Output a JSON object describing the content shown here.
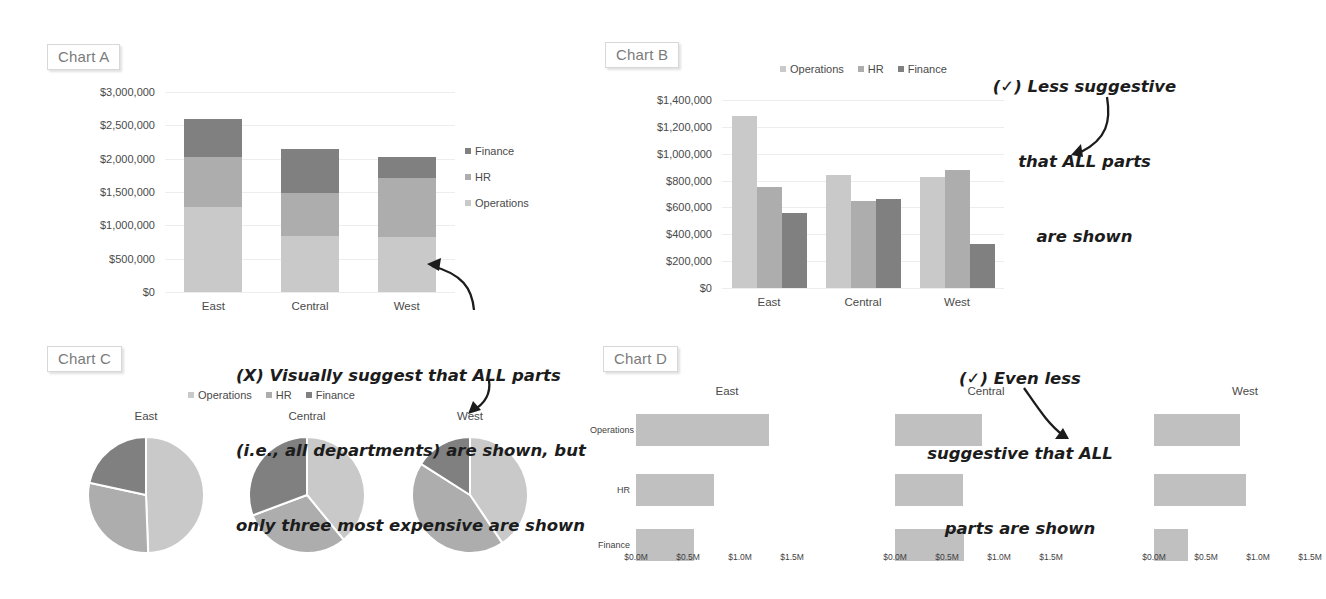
{
  "page": {
    "background": "#ffffff"
  },
  "palette": {
    "operations": "#c9c9c9",
    "hr": "#adadad",
    "finance": "#808080",
    "gridline": "#ededed",
    "axis_text": "#4a4a4a",
    "tag_text": "#7b7b7b",
    "tag_border": "#d8d8d8",
    "ink": "#1c1c1c"
  },
  "charts": {
    "a": {
      "tag": "Chart A",
      "legend": [
        {
          "label": "Finance",
          "color_key": "finance"
        },
        {
          "label": "HR",
          "color_key": "hr"
        },
        {
          "label": "Operations",
          "color_key": "operations"
        }
      ]
    },
    "b": {
      "tag": "Chart B",
      "legend": [
        {
          "label": "Operations",
          "color_key": "operations"
        },
        {
          "label": "HR",
          "color_key": "hr"
        },
        {
          "label": "Finance",
          "color_key": "finance"
        }
      ]
    },
    "c": {
      "tag": "Chart C",
      "legend": [
        {
          "label": "Operations",
          "color_key": "operations"
        },
        {
          "label": "HR",
          "color_key": "hr"
        },
        {
          "label": "Finance",
          "color_key": "finance"
        }
      ]
    },
    "d": {
      "tag": "Chart D"
    }
  },
  "annotations": [
    {
      "id": "note-chart-b",
      "marker": "(✓)",
      "lines": [
        "(✓) Less suggestive",
        "that ALL parts",
        "are shown"
      ],
      "text": "(✓) Less suggestive that ALL parts are shown",
      "target": "Chart B"
    },
    {
      "id": "note-chart-a",
      "marker": "(X)",
      "lines": [
        "(X) Visually suggest that ALL parts",
        "(i.e., all departments) are shown, but",
        "only three most expensive are shown"
      ],
      "text": "(X) Visually suggest that ALL parts (i.e., all departments) are shown, but only three most expensive are shown",
      "target": "Chart A and Chart C"
    },
    {
      "id": "note-chart-d",
      "marker": "(✓)",
      "lines": [
        "(✓) Even less",
        "suggestive that ALL",
        "parts are shown"
      ],
      "text": "(✓) Even less suggestive that ALL parts are shown",
      "target": "Chart D"
    }
  ],
  "chart_data": [
    {
      "id": "chart-a",
      "type": "bar",
      "subtype": "stacked-column",
      "title": "Chart A",
      "xlabel": "",
      "ylabel": "",
      "categories": [
        "East",
        "Central",
        "West"
      ],
      "series": [
        {
          "name": "Operations",
          "values": [
            1280000,
            840000,
            825000
          ],
          "color": "#c9c9c9"
        },
        {
          "name": "HR",
          "values": [
            750000,
            650000,
            880000
          ],
          "color": "#adadad"
        },
        {
          "name": "Finance",
          "values": [
            560000,
            660000,
            325000
          ],
          "color": "#808080"
        }
      ],
      "totals": [
        2590000,
        2150000,
        2030000
      ],
      "ylim": [
        0,
        3000000
      ],
      "ytick_values": [
        0,
        500000,
        1000000,
        1500000,
        2000000,
        2500000,
        3000000
      ],
      "ytick_labels": [
        "$0",
        "$500,000",
        "$1,000,000",
        "$1,500,000",
        "$2,000,000",
        "$2,500,000",
        "$3,000,000"
      ],
      "legend_position": "right",
      "legend_order": [
        "Finance",
        "HR",
        "Operations"
      ],
      "grid": true
    },
    {
      "id": "chart-b",
      "type": "bar",
      "subtype": "clustered-column",
      "title": "Chart B",
      "xlabel": "",
      "ylabel": "",
      "categories": [
        "East",
        "Central",
        "West"
      ],
      "series": [
        {
          "name": "Operations",
          "values": [
            1280000,
            840000,
            825000
          ],
          "color": "#c9c9c9"
        },
        {
          "name": "HR",
          "values": [
            750000,
            650000,
            880000
          ],
          "color": "#adadad"
        },
        {
          "name": "Finance",
          "values": [
            560000,
            660000,
            325000
          ],
          "color": "#808080"
        }
      ],
      "ylim": [
        0,
        1400000
      ],
      "ytick_values": [
        0,
        200000,
        400000,
        600000,
        800000,
        1000000,
        1200000,
        1400000
      ],
      "ytick_labels": [
        "$0",
        "$200,000",
        "$400,000",
        "$600,000",
        "$800,000",
        "$1,000,000",
        "$1,200,000",
        "$1,400,000"
      ],
      "legend_position": "top",
      "legend_order": [
        "Operations",
        "HR",
        "Finance"
      ],
      "grid": true
    },
    {
      "id": "chart-c",
      "type": "pie",
      "subtype": "pie-small-multiples",
      "title": "Chart C",
      "panels": [
        "East",
        "Central",
        "West"
      ],
      "legend_order": [
        "Operations",
        "HR",
        "Finance"
      ],
      "slices": [
        {
          "panel": "East",
          "labels": [
            "Operations",
            "HR",
            "Finance"
          ],
          "values": [
            1280000,
            750000,
            560000
          ],
          "percents": [
            49.4,
            29.0,
            21.6
          ],
          "colors": [
            "#c9c9c9",
            "#adadad",
            "#808080"
          ]
        },
        {
          "panel": "Central",
          "labels": [
            "Operations",
            "HR",
            "Finance"
          ],
          "values": [
            840000,
            650000,
            660000
          ],
          "percents": [
            39.1,
            30.2,
            30.7
          ],
          "colors": [
            "#c9c9c9",
            "#adadad",
            "#808080"
          ]
        },
        {
          "panel": "West",
          "labels": [
            "Operations",
            "HR",
            "Finance"
          ],
          "values": [
            825000,
            880000,
            325000
          ],
          "percents": [
            40.6,
            43.4,
            16.0
          ],
          "colors": [
            "#c9c9c9",
            "#adadad",
            "#808080"
          ]
        }
      ],
      "legend_position": "top"
    },
    {
      "id": "chart-d",
      "type": "bar",
      "subtype": "horizontal-panel-bar",
      "title": "Chart D",
      "panels": [
        "East",
        "Central",
        "West"
      ],
      "categories": [
        "Operations",
        "HR",
        "Finance"
      ],
      "bar_color": "#c0c0c0",
      "series": [
        {
          "name": "East",
          "values": [
            1280000,
            750000,
            560000
          ]
        },
        {
          "name": "Central",
          "values": [
            840000,
            650000,
            660000
          ]
        },
        {
          "name": "West",
          "values": [
            825000,
            880000,
            325000
          ]
        }
      ],
      "xlim": [
        0,
        1750000
      ],
      "xtick_values": [
        0,
        500000,
        1000000,
        1500000
      ],
      "xtick_labels": [
        "$0.0M",
        "$0.5M",
        "$1.0M",
        "$1.5M"
      ],
      "grid": false
    }
  ]
}
